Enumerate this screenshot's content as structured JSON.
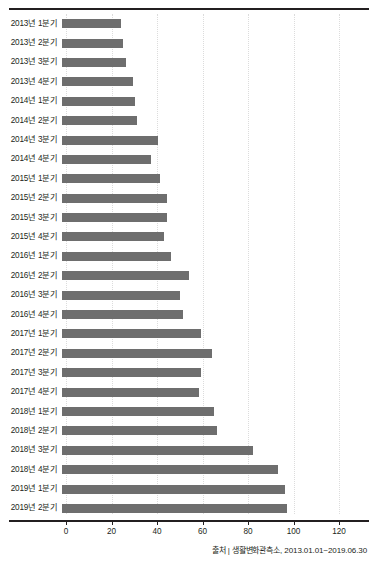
{
  "chart_data": {
    "type": "bar",
    "orientation": "horizontal",
    "title": "",
    "xlabel": "",
    "ylabel": "",
    "xlim": [
      0,
      128
    ],
    "xticks": [
      0,
      20,
      40,
      60,
      80,
      100,
      120
    ],
    "grid": true,
    "grid_axis": "x",
    "legend": false,
    "bar_color": "#6e6e6e",
    "categories": [
      "2013년 1분기",
      "2013년 2분기",
      "2013년 3분기",
      "2013년 4분기",
      "2014년 1분기",
      "2014년 2분기",
      "2014년 3분기",
      "2014년 4분기",
      "2015년 1분기",
      "2015년 2분기",
      "2015년 3분기",
      "2015년 4분기",
      "2016년 1분기",
      "2016년 2분기",
      "2016년 3분기",
      "2016년 4분기",
      "2017년 1분기",
      "2017년 2분기",
      "2017년 3분기",
      "2017년 4분기",
      "2018년 1분기",
      "2018년 2분기",
      "2018년 3분기",
      "2018년 4분기",
      "2019년 1분기",
      "2019년 2분기"
    ],
    "values": [
      26,
      27,
      28,
      31,
      32,
      33,
      42,
      39,
      43,
      46,
      46,
      45,
      48,
      56,
      52,
      53,
      61,
      66,
      61,
      60,
      67,
      68,
      84,
      95,
      98,
      99
    ]
  },
  "axis": {
    "tick_labels": [
      "0",
      "20",
      "40",
      "60",
      "80",
      "100",
      "120"
    ]
  },
  "footer": {
    "source": "출처 | 생활변화관측소, 2013.01.01~2019.06.30"
  }
}
